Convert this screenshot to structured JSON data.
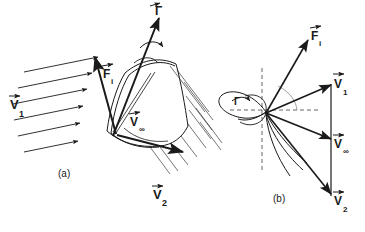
{
  "figure": {
    "title": "",
    "background": "#ffffff",
    "stroke": "#1a1a1a",
    "panels": [
      {
        "id": "a",
        "caption": "(a)",
        "description": "Three-dimensional cambered blade with incoming flow V1, resultant induced force Fi, mean velocity V-infinity, circulation Gamma axis and outgoing flow V2",
        "labels": {
          "v1": "V",
          "v1_sub": "1",
          "fi": "F",
          "fi_sub": "i",
          "vinf": "V",
          "vinf_sub": "∞",
          "v2": "V",
          "v2_sub": "2",
          "gamma": "Γ"
        }
      },
      {
        "id": "b",
        "caption": "(b)",
        "description": "Two-dimensional airfoil section velocity triangle with V1, V-infinity, V2 and induced force Fi, bound circulation Gamma",
        "labels": {
          "v1": "V",
          "v1_sub": "1",
          "fi": "F",
          "fi_sub": "i",
          "vinf": "V",
          "vinf_sub": "∞",
          "v2": "V",
          "v2_sub": "2",
          "gamma": "Γ"
        }
      }
    ],
    "vector_arrow_accent": "→"
  }
}
